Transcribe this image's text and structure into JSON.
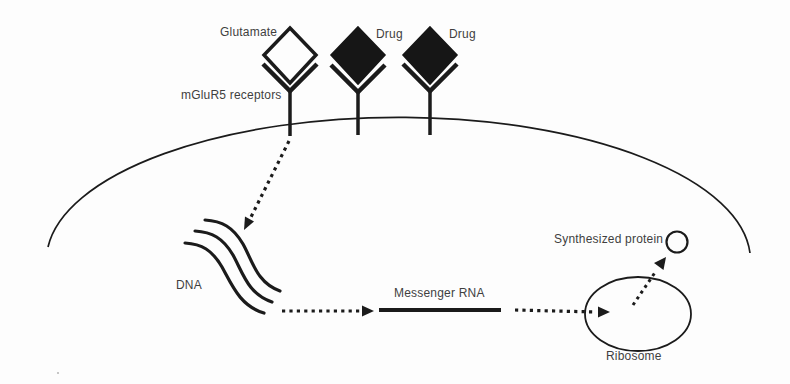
{
  "figure": {
    "type": "biology-pathway-diagram",
    "background": "#fdfdfd",
    "colors": {
      "ink": "#1b1b1b",
      "label_text": "#3f3f3f",
      "glutamate_diamond_fill": "#fdfdfd",
      "drug_diamond_fill": "#161616"
    },
    "labels": {
      "glutamate": "Glutamate",
      "drug_1": "Drug",
      "drug_2": "Drug",
      "mglur5": "mGluR5 receptors",
      "dna": "DNA",
      "messenger_rna": "Messenger RNA",
      "synthesized_protein": "Synthesized protein",
      "ribosome": "Ribosome"
    },
    "elements": {
      "receptor_count": 3,
      "ligands": [
        "Glutamate (open diamond)",
        "Drug (filled diamond)",
        "Drug (filled diamond)"
      ],
      "flow": [
        "mGluR5 receptor",
        "DNA",
        "Messenger RNA",
        "Ribosome",
        "Synthesized protein"
      ],
      "arrow_style": "dotted"
    }
  }
}
